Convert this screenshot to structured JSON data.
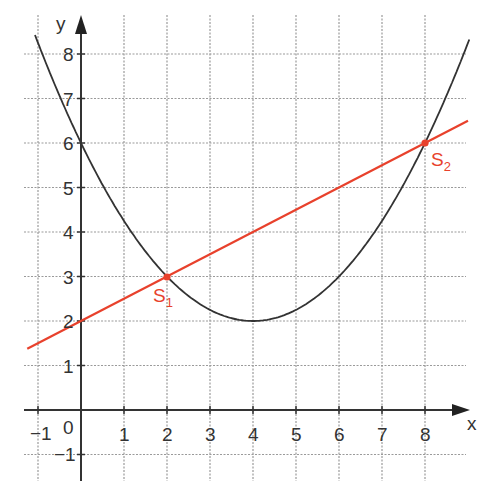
{
  "chart_data": {
    "type": "line",
    "title": "",
    "xlabel": "x",
    "ylabel": "y",
    "xlim": [
      -1.35,
      9
    ],
    "ylim": [
      -1.6,
      8.9
    ],
    "grid": true,
    "x_ticks": [
      "-1",
      "0",
      "1",
      "2",
      "3",
      "4",
      "5",
      "6",
      "7",
      "8"
    ],
    "y_ticks": [
      "-1",
      "1",
      "2",
      "3",
      "4",
      "5",
      "6",
      "7",
      "8"
    ],
    "origin_label": "0",
    "series": [
      {
        "name": "parabola",
        "equation": "y = 0.25(x - 4)^2 + 2",
        "color": "#333333",
        "x": [
          -1,
          0,
          1,
          2,
          3,
          4,
          5,
          6,
          7,
          8,
          9
        ],
        "values": [
          8.25,
          6,
          4.25,
          3,
          2.25,
          2,
          2.25,
          3,
          4.25,
          6,
          8.25
        ]
      },
      {
        "name": "line",
        "equation": "y = 0.5x + 2",
        "color": "#e8412c",
        "x": [
          -1.25,
          0,
          2,
          4,
          6,
          8,
          9
        ],
        "values": [
          1.375,
          2,
          3,
          4,
          5,
          6,
          6.5
        ]
      }
    ],
    "annotations": [
      {
        "label": "S",
        "subscript": "1",
        "x": 2,
        "y": 3,
        "color": "#e8412c"
      },
      {
        "label": "S",
        "subscript": "2",
        "x": 8,
        "y": 6,
        "color": "#e8412c"
      }
    ]
  },
  "labels": {
    "x_axis": "x",
    "y_axis": "y",
    "origin": "0",
    "s1": "S",
    "s1_sub": "1",
    "s2": "S",
    "s2_sub": "2",
    "xt": {
      "m1": "−1",
      "1": "1",
      "2": "2",
      "3": "3",
      "4": "4",
      "5": "5",
      "6": "6",
      "7": "7",
      "8": "8"
    },
    "yt": {
      "m1": "−1",
      "1": "1",
      "2": "2",
      "3": "3",
      "4": "4",
      "5": "5",
      "6": "6",
      "7": "7",
      "8": "8"
    }
  },
  "colors": {
    "axis": "#333333",
    "grid": "#9a9a9a",
    "parabola": "#333333",
    "line": "#e8412c"
  }
}
